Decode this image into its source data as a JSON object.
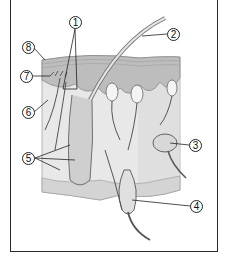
{
  "figure": {
    "title": "",
    "colors": {
      "frame": "#2a2a2a",
      "epidermis": "#cfcfcf",
      "dermis": "#e6e6e6",
      "subcutis": "#d9d9d9",
      "outline": "#555555",
      "leader": "#222222"
    }
  },
  "callouts": [
    {
      "id": "c1",
      "label": "1",
      "x": 69,
      "y": 16
    },
    {
      "id": "c2",
      "label": "2",
      "x": 167,
      "y": 28
    },
    {
      "id": "c3",
      "label": "3",
      "x": 189,
      "y": 139
    },
    {
      "id": "c4",
      "label": "4",
      "x": 190,
      "y": 200
    },
    {
      "id": "c5",
      "label": "5",
      "x": 22,
      "y": 152
    },
    {
      "id": "c6",
      "label": "6",
      "x": 22,
      "y": 106
    },
    {
      "id": "c7",
      "label": "7",
      "x": 20,
      "y": 70
    },
    {
      "id": "c8",
      "label": "8",
      "x": 22,
      "y": 41
    }
  ]
}
